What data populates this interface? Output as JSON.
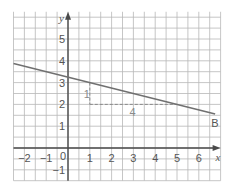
{
  "chart_data": {
    "type": "line",
    "title": "",
    "xlabel": "x",
    "ylabel": "y",
    "xlim": [
      -2.5,
      7
    ],
    "ylim": [
      -1.5,
      6.25
    ],
    "grid": true,
    "grid_step": 0.5,
    "x_ticks": [
      "-2",
      "-1",
      "0",
      "1",
      "2",
      "3",
      "4",
      "5",
      "6"
    ],
    "y_ticks": [
      "-1",
      "1",
      "2",
      "3",
      "4",
      "5"
    ],
    "series": [
      {
        "name": "line",
        "equation": "y = -0.25x + 3.25",
        "x": [
          -2.5,
          6.75
        ],
        "y": [
          3.875,
          1.5625
        ],
        "color": "#707070"
      }
    ],
    "annotations": [
      {
        "type": "label",
        "text": "B",
        "x": 6.75,
        "y": 1.5625
      },
      {
        "type": "rise_run_triangle",
        "from": [
          1,
          3
        ],
        "corner": [
          1,
          2
        ],
        "to": [
          5,
          2
        ],
        "rise_label": "1",
        "run_label": "4",
        "style": "dashed"
      }
    ]
  },
  "labels": {
    "x_axis": "x",
    "y_axis": "y",
    "origin": "0",
    "point_b": "B",
    "rise": "1",
    "run": "4",
    "x_ticks": [
      "-2",
      "-1",
      "1",
      "2",
      "3",
      "4",
      "5",
      "6"
    ],
    "y_ticks": [
      "-1",
      "1",
      "2",
      "3",
      "4",
      "5"
    ]
  },
  "colors": {
    "grid": "#b8b8b8",
    "axis": "#4a4a4a",
    "line": "#707070",
    "dashed": "#8a8a8a",
    "text": "#555555"
  }
}
